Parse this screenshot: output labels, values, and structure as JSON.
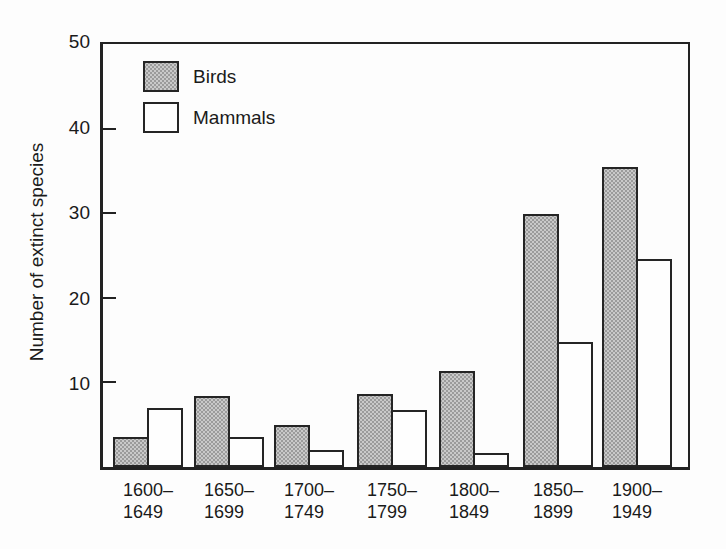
{
  "chart_data": {
    "type": "bar",
    "title": "",
    "xlabel": "",
    "ylabel": "Number of extinct species",
    "ylim": [
      0,
      50
    ],
    "yticks": [
      10,
      20,
      30,
      40,
      50
    ],
    "grid": false,
    "legend_position": "top-left-inside",
    "categories": [
      "1600–1649",
      "1650–1699",
      "1700–1749",
      "1750–1799",
      "1800–1849",
      "1850–1899",
      "1900–1949"
    ],
    "series": [
      {
        "name": "Birds",
        "fill": "#b8b8b8",
        "pattern": "halftone-dots",
        "values": [
          3.5,
          8.4,
          5,
          8.6,
          11.3,
          29.9,
          35.5
        ]
      },
      {
        "name": "Mammals",
        "fill": "#ffffff",
        "pattern": "none",
        "values": [
          7,
          3.5,
          2,
          6.7,
          1.7,
          14.8,
          24.6
        ]
      }
    ],
    "colors": {
      "bar_border": "#252525",
      "axis": "#222222",
      "background": "#fdfdfd"
    }
  }
}
